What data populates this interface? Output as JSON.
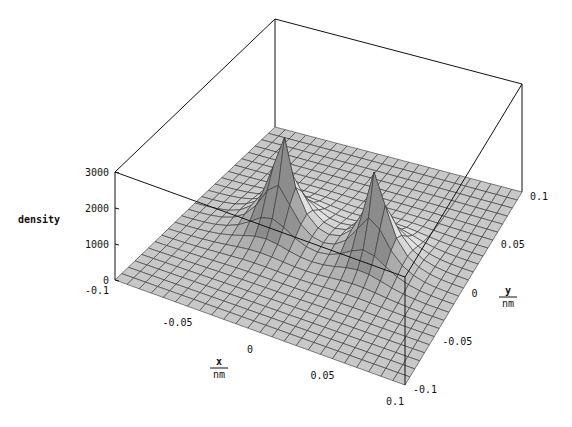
{
  "chart_data": {
    "type": "surface3d",
    "title": "",
    "xlabel": "x/nm",
    "ylabel": "y/nm",
    "zlabel": "density",
    "x_ticks": [
      "-0.1",
      "-0.05",
      "0",
      "0.05",
      "0.1"
    ],
    "y_ticks": [
      "-0.1",
      "-0.05",
      "0",
      "0.05",
      "0.1"
    ],
    "z_ticks": [
      "0",
      "1000",
      "2000",
      "3000"
    ],
    "xlim": [
      -0.1,
      0.1
    ],
    "ylim": [
      -0.1,
      0.1
    ],
    "zlim": [
      0,
      3000
    ],
    "peaks": [
      {
        "x": -0.035,
        "y": 0.0,
        "density": 3000
      },
      {
        "x": 0.035,
        "y": 0.0,
        "density": 2800
      }
    ],
    "grid": true,
    "mesh_color": "#333333",
    "surface_color": "#c8c8c8"
  },
  "axes": {
    "z_label": "density",
    "x_label_num": "x",
    "x_label_den": "nm",
    "y_label_num": "y",
    "y_label_den": "nm"
  }
}
